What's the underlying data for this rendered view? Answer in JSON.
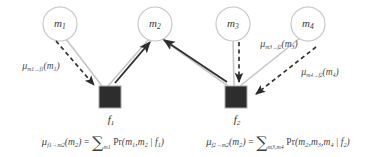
{
  "figure": {
    "type": "factor-graph-message-passing-diagram",
    "background_color": "#ffffff",
    "variable_node_stroke": "#bdbdbd",
    "variable_node_fill": "#ffffff",
    "factor_node_fill": "#2b2b2b",
    "factor_node_stroke": "#9a9a9a",
    "edge_color": "#c2c2c2",
    "solid_arrow_color": "#2f2f2f",
    "dashed_arrow_color": "#3a3a3a",
    "text_color": "#3f3f3f"
  },
  "variable_nodes": [
    {
      "id": "m1",
      "label": "m",
      "sub": "1",
      "cx": 60,
      "cy": 24,
      "r": 17
    },
    {
      "id": "m2",
      "label": "m",
      "sub": "2",
      "cx": 155,
      "cy": 24,
      "r": 17
    },
    {
      "id": "m3",
      "label": "m",
      "sub": "3",
      "cx": 233,
      "cy": 24,
      "r": 17
    },
    {
      "id": "m4",
      "label": "m",
      "sub": "4",
      "cx": 308,
      "cy": 24,
      "r": 17
    }
  ],
  "factor_nodes": [
    {
      "id": "f1",
      "label": "f",
      "sub": "1",
      "x": 100,
      "y": 87,
      "size": 22,
      "label_x": 111,
      "label_y": 120
    },
    {
      "id": "f2",
      "label": "f",
      "sub": "2",
      "x": 226,
      "y": 87,
      "size": 22,
      "label_x": 237,
      "label_y": 120
    }
  ],
  "edges": [
    {
      "from": "m1",
      "to": "f1"
    },
    {
      "from": "m2",
      "to": "f1"
    },
    {
      "from": "m2",
      "to": "f2"
    },
    {
      "from": "m3",
      "to": "f2"
    },
    {
      "from": "m4",
      "to": "f2"
    }
  ],
  "messages": [
    {
      "id": "mu-m1-f1",
      "style": "dashed",
      "direction": "m1-to-f1",
      "mu": "μ",
      "subscript": "m1→f1",
      "sub_from": "m1",
      "sub_arrow": "→",
      "sub_to": "f1",
      "arg_open": "(",
      "arg": "m",
      "arg_sub": "1",
      "arg_close": ")",
      "label_x": 41,
      "label_y": 66
    },
    {
      "id": "mu-m3-f2",
      "style": "dashed",
      "direction": "m3-to-f2",
      "mu": "μ",
      "subscript": "m3→f2",
      "sub_from": "m3",
      "sub_arrow": "→",
      "sub_to": "f2",
      "arg_open": "(",
      "arg": "m",
      "arg_sub": "3",
      "arg_close": ")",
      "label_x": 279,
      "label_y": 44
    },
    {
      "id": "mu-m4-f2",
      "style": "dashed",
      "direction": "m4-to-f2",
      "mu": "μ",
      "subscript": "m4→f2",
      "sub_from": "m4",
      "sub_arrow": "→",
      "sub_to": "f2",
      "arg_open": "(",
      "arg": "m",
      "arg_sub": "4",
      "arg_close": ")",
      "label_x": 320,
      "label_y": 72
    },
    {
      "id": "mu-f1-m2",
      "style": "solid",
      "direction": "f1-to-m2"
    },
    {
      "id": "mu-f2-m2",
      "style": "solid",
      "direction": "f2-to-m2"
    }
  ],
  "formulas": [
    {
      "id": "formula-f1-m2",
      "mu": "μ",
      "sub": "f1→m2",
      "arg_open": "(",
      "arg": "m",
      "arg_sub": "2",
      "arg_close": ")",
      "equals": "=",
      "sigma": "∑",
      "sigma_sub": "m1",
      "pr": "Pr",
      "body_open": "(",
      "body": "m1, m2 | f1",
      "body_close": ")",
      "vars": [
        "m",
        "m"
      ],
      "var_subs": [
        "1",
        "2"
      ],
      "cond_var": "f",
      "cond_sub": "1",
      "center_x": 103,
      "center_y": 142
    },
    {
      "id": "formula-f2-m2",
      "mu": "μ",
      "sub": "f2→m2",
      "arg_open": "(",
      "arg": "m",
      "arg_sub": "2",
      "arg_close": ")",
      "equals": "=",
      "sigma": "∑",
      "sigma_sub": "m3,m4",
      "pr": "Pr",
      "body_open": "(",
      "body": "m2, m3, m4 | f2",
      "body_close": ")",
      "vars": [
        "m",
        "m",
        "m"
      ],
      "var_subs": [
        "2",
        "3",
        "4"
      ],
      "cond_var": "f",
      "cond_sub": "2",
      "center_x": 278,
      "center_y": 142
    }
  ]
}
